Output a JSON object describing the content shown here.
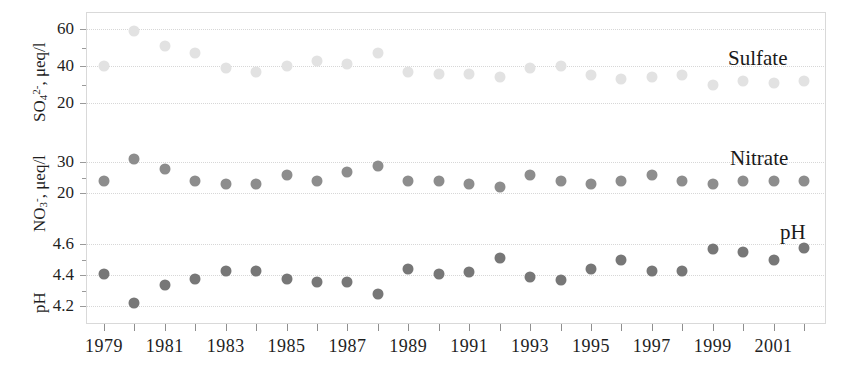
{
  "figure": {
    "background": "#ffffff",
    "frame_color": "#d9d9d9",
    "grid_color": "#d7d7d7"
  },
  "colors": {
    "sulfate": "#e2e2e2",
    "nitrate": "#8d8d8d",
    "ph": "#777777",
    "text": "#1f1f1f"
  },
  "panels": [
    {
      "key": "sulfate",
      "series_label": "Sulfate",
      "axis_title_main": "SO",
      "axis_title_sub": "4",
      "axis_title_sup": "2-",
      "axis_title_unit": ", μeq/l",
      "ticks": [
        "60",
        "40",
        "20"
      ]
    },
    {
      "key": "nitrate",
      "series_label": "Nitrate",
      "axis_title_main": "NO",
      "axis_title_sub": "3",
      "axis_title_sup": "-",
      "axis_title_unit": ", μeq/l",
      "ticks": [
        "30",
        "20"
      ]
    },
    {
      "key": "ph",
      "series_label": "pH",
      "axis_title_main": "pH",
      "axis_title_sub": "",
      "axis_title_sup": "",
      "axis_title_unit": "",
      "ticks": [
        "4.6",
        "4.4",
        "4.2"
      ]
    }
  ],
  "xaxis": {
    "tick_labels": [
      "1979",
      "1981",
      "1983",
      "1985",
      "1987",
      "1989",
      "1991",
      "1993",
      "1995",
      "1997",
      "1999",
      "2001"
    ],
    "first_year": 1979,
    "last_year": 2002
  },
  "chart_data": {
    "type": "scatter",
    "title": "",
    "xlabel": "",
    "grid": true,
    "legend": "inline-right-annotations",
    "x": [
      1979,
      1980,
      1981,
      1982,
      1983,
      1984,
      1985,
      1986,
      1987,
      1988,
      1989,
      1990,
      1991,
      1992,
      1993,
      1994,
      1995,
      1996,
      1997,
      1998,
      1999,
      2000,
      2001,
      2002
    ],
    "panels": [
      {
        "name": "Sulfate",
        "ylabel": "SO4 2-, μeq/l",
        "ylim": [
          10,
          68
        ],
        "yticks": [
          20,
          40,
          60
        ],
        "color": "#e2e2e2",
        "values": [
          40,
          59,
          51,
          47,
          39,
          37,
          40,
          43,
          41,
          47,
          37,
          36,
          36,
          34,
          39,
          40,
          35,
          33,
          34,
          35,
          30,
          32,
          31,
          32
        ]
      },
      {
        "name": "Nitrate",
        "ylabel": "NO3 -, μeq/l",
        "ylim": [
          14,
          34
        ],
        "yticks": [
          20,
          30
        ],
        "color": "#8d8d8d",
        "values": [
          24,
          31,
          28,
          24,
          23,
          23,
          26,
          24,
          27,
          29,
          24,
          24,
          23,
          22,
          26,
          24,
          23,
          24,
          26,
          24,
          23,
          24,
          24,
          24
        ]
      },
      {
        "name": "pH",
        "ylabel": "pH",
        "ylim": [
          4.1,
          4.68
        ],
        "yticks": [
          4.2,
          4.4,
          4.6
        ],
        "color": "#777777",
        "values": [
          4.41,
          4.22,
          4.34,
          4.38,
          4.43,
          4.43,
          4.38,
          4.36,
          4.36,
          4.28,
          4.44,
          4.41,
          4.42,
          4.51,
          4.39,
          4.37,
          4.44,
          4.5,
          4.43,
          4.43,
          4.57,
          4.55,
          4.5,
          4.58
        ]
      }
    ]
  }
}
